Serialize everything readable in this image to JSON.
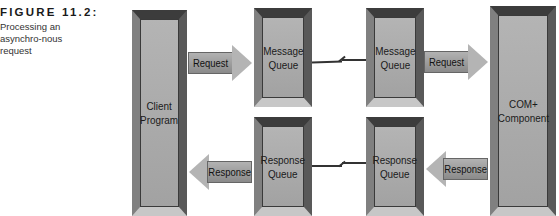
{
  "caption": {
    "figure_label": "FIGURE 11.2:",
    "text": "Processing an asynchro-nous request"
  },
  "nodes": {
    "client": {
      "label_line1": "Client",
      "label_line2": "Program"
    },
    "message_queue_1": {
      "label_line1": "Message",
      "label_line2": "Queue"
    },
    "message_queue_2": {
      "label_line1": "Message",
      "label_line2": "Queue"
    },
    "response_queue_1": {
      "label_line1": "Response",
      "label_line2": "Queue"
    },
    "response_queue_2": {
      "label_line1": "Response",
      "label_line2": "Queue"
    },
    "com_component": {
      "label_line1": "COM+",
      "label_line2": "Component"
    }
  },
  "edges": {
    "request_1": "Request",
    "request_2": "Request",
    "response_1": "Response",
    "response_2": "Response"
  }
}
